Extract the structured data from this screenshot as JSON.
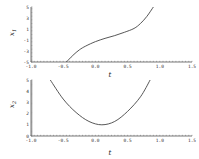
{
  "chart_data": [
    {
      "type": "line",
      "title": "",
      "xlabel": "t",
      "ylabel": "x1",
      "xlim": [
        -1.0,
        1.5
      ],
      "ylim": [
        -5,
        5
      ],
      "xticks": [
        "-1.0",
        "-0.5",
        "0.0",
        "0.5",
        "1.0",
        "1.5"
      ],
      "yticks": [
        "5",
        "3",
        "1",
        "-1",
        "-3",
        "-5"
      ],
      "grid": false,
      "series": [
        {
          "name": "x1(t)",
          "x": [
            -0.45,
            -0.35,
            -0.25,
            -0.15,
            0.0,
            0.15,
            0.3,
            0.45,
            0.6,
            0.7,
            0.8,
            0.9
          ],
          "y": [
            -5.0,
            -3.8,
            -2.8,
            -2.1,
            -1.3,
            -0.7,
            -0.2,
            0.4,
            1.1,
            2.0,
            3.3,
            5.0
          ]
        }
      ]
    },
    {
      "type": "line",
      "title": "",
      "xlabel": "t",
      "ylabel": "x2",
      "xlim": [
        -1.0,
        1.5
      ],
      "ylim": [
        0,
        5
      ],
      "xticks": [
        "-1.0",
        "-0.5",
        "0.0",
        "0.5",
        "1.0",
        "1.5"
      ],
      "yticks": [
        "5",
        "4",
        "3",
        "2",
        "1",
        "0"
      ],
      "grid": false,
      "series": [
        {
          "name": "x2(t)",
          "x": [
            -0.7,
            -0.5,
            -0.3,
            -0.1,
            0.1,
            0.3,
            0.5,
            0.7,
            0.85
          ],
          "y": [
            5.0,
            3.3,
            2.1,
            1.3,
            1.0,
            1.3,
            2.2,
            3.5,
            5.0
          ]
        }
      ]
    }
  ],
  "plots": {
    "top": {
      "ylabel_main": "x",
      "ylabel_sub": "1",
      "xlabel": "t"
    },
    "bottom": {
      "ylabel_main": "x",
      "ylabel_sub": "2",
      "xlabel": "t"
    }
  }
}
